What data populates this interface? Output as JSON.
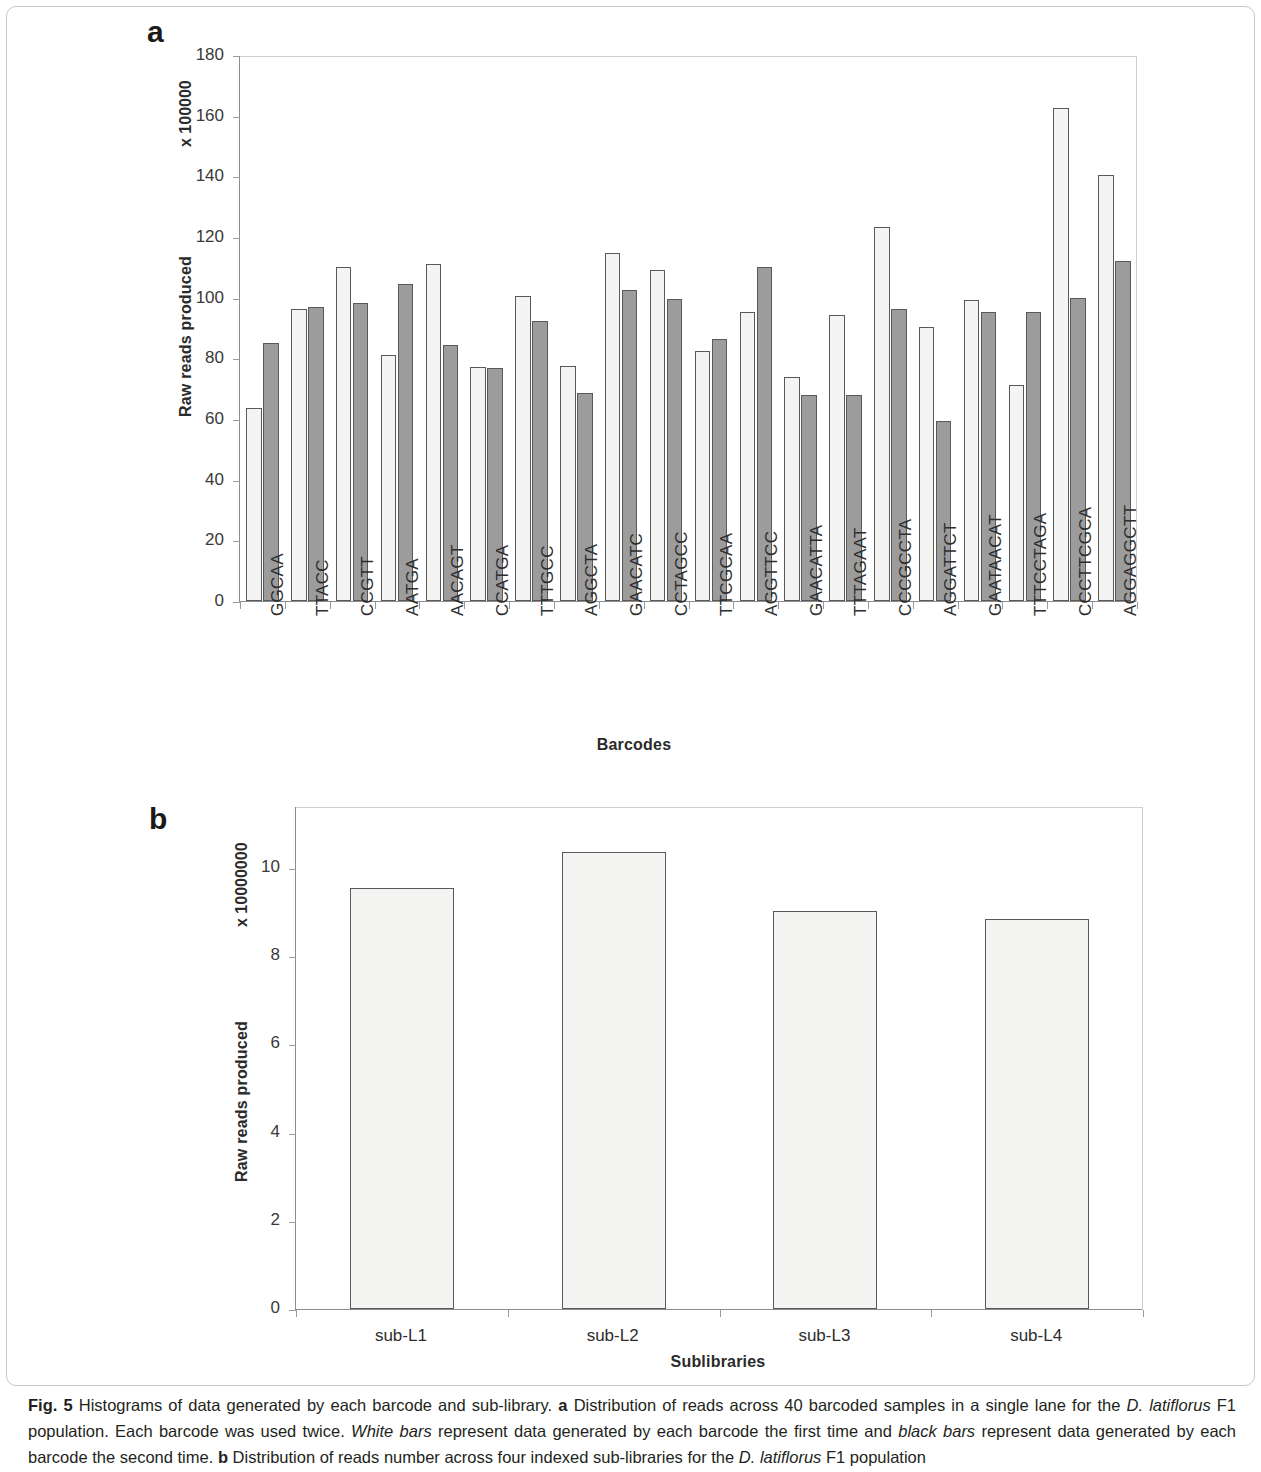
{
  "figure": {
    "caption_label": "Fig. 5",
    "caption_text_1": "Histograms of data generated by each barcode and sub-library.",
    "caption_a_marker": "a",
    "caption_text_2": "Distribution of reads across 40 barcoded samples in a single lane for the",
    "caption_italic_1": "D. latiflorus",
    "caption_text_3": "F1 population. Each barcode was used twice.",
    "caption_italic_2": "White bars",
    "caption_text_4": "represent data generated by each barcode the first time and",
    "caption_italic_3": "black bars",
    "caption_text_5": "represent data generated by each barcode the second time.",
    "caption_b_marker": "b",
    "caption_text_6": "Distribution of reads number across four indexed sub-libraries for the",
    "caption_italic_4": "D. latiflorus",
    "caption_text_7": "F1 population"
  },
  "panel_a": {
    "letter": "a",
    "unit_label": "x 100000",
    "ylabel": "Raw reads produced",
    "xlabel": "Barcodes"
  },
  "panel_b": {
    "letter": "b",
    "unit_label": "x 10000000",
    "ylabel": "Raw reads produced",
    "xlabel": "Sublibraries"
  },
  "colors": {
    "white_bar": "#f4f4f2",
    "gray_bar": "#9c9c9c",
    "bar_outline": "#59595b",
    "axis": "#8d8d8d",
    "text": "#2e2e2e"
  },
  "chart_data": [
    {
      "type": "bar",
      "panel": "a",
      "title": "",
      "xlabel": "Barcodes",
      "ylabel": "Raw reads produced",
      "y_unit": "x 100000",
      "ylim": [
        0,
        180
      ],
      "yticks": [
        0,
        20,
        40,
        60,
        80,
        100,
        120,
        140,
        160,
        180
      ],
      "grid": false,
      "legend": [
        "White bars (first time)",
        "black bars (second time)"
      ],
      "legend_position": "none",
      "categories": [
        "GGCAA",
        "TTACC",
        "CCGTT",
        "AATGA",
        "AACAGT",
        "CCATGA",
        "TTTGCC",
        "AGGCTA",
        "GAACATC",
        "CCTAGCC",
        "TTCGCAA",
        "AGGTTCC",
        "GAACATTA",
        "TTTAGAAT",
        "CCCGCCTA",
        "AGGATTCT",
        "GAATAACAT",
        "TTTCCTAGA",
        "CCCTTCGCA",
        "AGGAGGCTT"
      ],
      "series": [
        {
          "name": "White bars (first time)",
          "color": "#f4f4f2",
          "values": [
            63.6,
            96.2,
            110.0,
            81.2,
            111.2,
            77.0,
            100.6,
            77.5,
            114.8,
            109.0,
            82.5,
            95.2,
            73.8,
            94.2,
            123.2,
            90.2,
            99.4,
            71.2,
            162.6,
            140.4
          ]
        },
        {
          "name": "black bars (second time)",
          "color": "#9c9c9c",
          "values": [
            85.0,
            97.0,
            98.2,
            104.5,
            84.5,
            76.8,
            92.2,
            68.5,
            102.5,
            99.6,
            86.4,
            110.0,
            68.0,
            67.8,
            96.2,
            59.2,
            95.2,
            95.4,
            100.0,
            112.0
          ]
        }
      ]
    },
    {
      "type": "bar",
      "panel": "b",
      "title": "",
      "xlabel": "Sublibraries",
      "ylabel": "Raw reads produced",
      "y_unit": "x 10000000",
      "ylim": [
        0,
        11.4
      ],
      "yticks": [
        0,
        2,
        4,
        6,
        8,
        10
      ],
      "grid": false,
      "categories": [
        "sub-L1",
        "sub-L2",
        "sub-L3",
        "sub-L4"
      ],
      "values": [
        9.55,
        10.35,
        9.02,
        8.85
      ],
      "color": "#f4f4f2"
    }
  ]
}
